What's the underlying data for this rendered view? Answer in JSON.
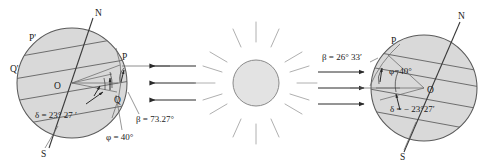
{
  "figure": {
    "background_color": "#ffffff",
    "globe_fill_color": "#d9d9d9",
    "sun_fill_color": "#e3e3e3"
  },
  "left_globe": {
    "name": "summer-solstice-earth",
    "pole_north_label": "N",
    "pole_south_label": "S",
    "center_label": "O",
    "point_p_label": "P",
    "point_q_label": "Q",
    "point_p_prime_label": "P'",
    "point_q_prime_label": "Q'",
    "declination_label": "δ = 23° 27 ′",
    "latitude_label": "φ = 40°",
    "altitude_label": "β = 73.27°",
    "declination_value": 23.45,
    "latitude_value": 40,
    "altitude_value": 73.27
  },
  "sun": {
    "name": "sun",
    "ray_count": 16
  },
  "rays_left": {
    "name": "sunrays-toward-left-earth",
    "direction": "left",
    "count": 3
  },
  "rays_right": {
    "name": "sunrays-toward-right-earth",
    "direction": "right",
    "count": 3
  },
  "right_globe": {
    "name": "winter-solstice-earth",
    "pole_north_label": "N",
    "pole_south_label": "S",
    "center_label": "O",
    "point_p_label": "P",
    "declination_label": "δ = − 23°27′",
    "latitude_label": "φ=40°",
    "altitude_label": "β = 26° 33′",
    "declination_value": -23.45,
    "latitude_value": 40,
    "altitude_value": 26.55
  }
}
